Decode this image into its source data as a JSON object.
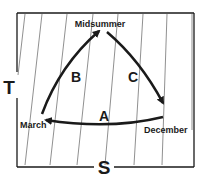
{
  "diagram": {
    "axes": {
      "y_label": "T",
      "x_label": "S"
    },
    "points": {
      "top": "Midsummer",
      "left": "March",
      "right": "December"
    },
    "arrows": [
      {
        "label": "A",
        "from": "December",
        "to": "March"
      },
      {
        "label": "B",
        "from": "March",
        "to": "Midsummer"
      },
      {
        "label": "C",
        "from": "Midsummer",
        "to": "December"
      }
    ],
    "colors": {
      "line": "#1a1a1a",
      "background": "#ffffff",
      "hatch": "#333333"
    }
  }
}
